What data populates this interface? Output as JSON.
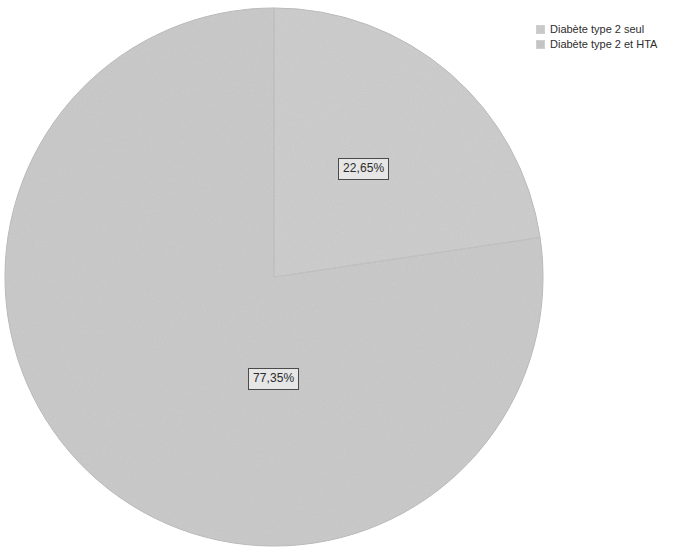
{
  "chart_data": {
    "type": "pie",
    "title": "",
    "subtitle": "",
    "xlabel": "",
    "ylabel": "",
    "grid": false,
    "legend_position": "top-right",
    "start_angle_deg": 0,
    "direction": "clockwise",
    "categories": [
      "Diabète type 2 seul",
      "Diabète type 2 et HTA"
    ],
    "values": [
      22.65,
      77.35
    ],
    "value_labels": [
      "22,65%",
      "77,35%"
    ],
    "units": "%",
    "slices": [
      {
        "name": "Diabète type 2 seul",
        "value": 22.65,
        "label": "22,65%",
        "color": "#c9c9c9",
        "start_deg": 0,
        "end_deg": 81.54
      },
      {
        "name": "Diabète type 2 et HTA",
        "value": 77.35,
        "label": "77,35%",
        "color": "#c4c4c4",
        "start_deg": 81.54,
        "end_deg": 360
      }
    ]
  },
  "geometry": {
    "center_x": 274,
    "center_y": 277,
    "radius": 269
  },
  "legend": {
    "items": [
      {
        "label": "Diabète type 2 seul",
        "color": "#c9c9c9"
      },
      {
        "label": "Diabète type 2 et HTA",
        "color": "#c4c4c4"
      }
    ]
  },
  "colors": {
    "background": "#ffffff",
    "slice_one": "#c9c9c9",
    "slice_two": "#c4c4c4",
    "slice_outline": "#b4b4b4",
    "label_border": "#4a4a4a",
    "label_fill": "#e6e6e6",
    "text": "#2e2e2e"
  }
}
